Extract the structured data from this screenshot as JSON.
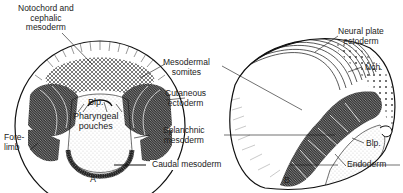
{
  "figure": {
    "panel_a": {
      "letter": "A",
      "labels": {
        "notochord_l1": "Notochord and",
        "notochord_l2": "cephalic",
        "notochord_l3": "mesoderm",
        "blp": "Blp.",
        "pharyngeal_l1": "Pharyngeal",
        "pharyngeal_l2": "pouches",
        "fore_l1": "Fore-",
        "fore_l2": "limb"
      }
    },
    "shared_labels": {
      "mesodermal_l1": "Mesodermal",
      "mesodermal_l2": "somites",
      "cutaneous_l1": "Cutaneous",
      "cutaneous_l2": "ectoderm",
      "splanchnic_l1": "Splanchnic",
      "splanchnic_l2": "mesoderm",
      "caudal": "Caudal mesoderm"
    },
    "panel_b": {
      "letter": "B",
      "labels": {
        "neural_l1": "Neural plate",
        "neural_l2": "ectoderm",
        "nch": "Nch.",
        "blp": "Blp.",
        "endoderm": "Endoderm"
      }
    },
    "colors": {
      "ink": "#1a1a1a",
      "background": "#ffffff"
    }
  }
}
